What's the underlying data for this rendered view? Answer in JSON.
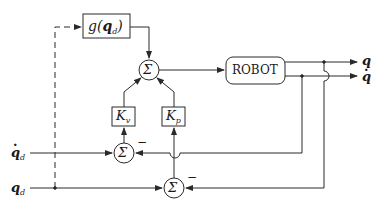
{
  "diagram": {
    "type": "control-block-diagram",
    "blocks": {
      "gravity": {
        "func": "g",
        "arg": "q",
        "arg_sub": "d"
      },
      "robot": {
        "label": "ROBOT"
      },
      "kv": {
        "symbol": "K",
        "sub": "v"
      },
      "kp": {
        "symbol": "K",
        "sub": "p"
      }
    },
    "summers": {
      "top": {
        "symbol": "Σ"
      },
      "velocity": {
        "symbol": "Σ",
        "feedback_sign": "−"
      },
      "position": {
        "symbol": "Σ",
        "feedback_sign": "−"
      }
    },
    "inputs": {
      "qd_dot": {
        "symbol": "q",
        "sub": "d",
        "dotted": true
      },
      "qd": {
        "symbol": "q",
        "sub": "d",
        "dotted": false
      }
    },
    "outputs": {
      "q": {
        "symbol": "q"
      },
      "q_dot": {
        "symbol": "q",
        "dotted": true
      }
    },
    "colors": {
      "line": "#2a2a2a",
      "background": "#ffffff"
    }
  }
}
